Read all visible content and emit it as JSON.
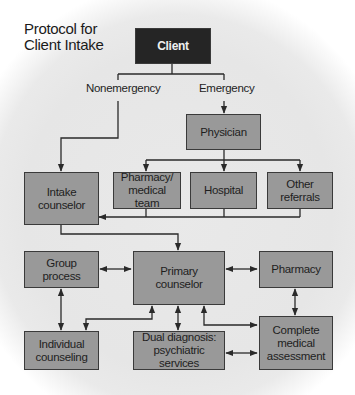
{
  "title": {
    "line1": "Protocol for",
    "line2": "Client Intake"
  },
  "colors": {
    "node_fill": "#999999",
    "start_fill": "#252525",
    "line": "#2a2a2a",
    "background": "#e6e6e6"
  },
  "branch_labels": {
    "nonemergency": "Nonemergency",
    "emergency": "Emergency"
  },
  "nodes": {
    "client": "Client",
    "physician": "Physician",
    "pharmacy_medical_team": {
      "line1": "Pharmacy/",
      "line2": "medical team"
    },
    "hospital": "Hospital",
    "other_referrals": {
      "line1": "Other",
      "line2": "referrals"
    },
    "intake_counselor": {
      "line1": "Intake",
      "line2": "counselor"
    },
    "group_process": {
      "line1": "Group",
      "line2": "process"
    },
    "primary_counselor": {
      "line1": "Primary",
      "line2": "counselor"
    },
    "pharmacy": "Pharmacy",
    "individual_counseling": {
      "line1": "Individual",
      "line2": "counseling"
    },
    "dual_diagnosis": {
      "line1": "Dual diagnosis:",
      "line2": "psychiatric services"
    },
    "complete_medical_assessment": {
      "line1": "Complete",
      "line2": "medical",
      "line3": "assessment"
    }
  },
  "edges": [
    {
      "from": "Client",
      "to": "Intake counselor",
      "label": "Nonemergency",
      "type": "one-way"
    },
    {
      "from": "Client",
      "to": "Physician",
      "label": "Emergency",
      "type": "one-way"
    },
    {
      "from": "Physician",
      "to": "Pharmacy/medical team",
      "type": "one-way"
    },
    {
      "from": "Physician",
      "to": "Hospital",
      "type": "one-way"
    },
    {
      "from": "Physician",
      "to": "Other referrals",
      "type": "one-way"
    },
    {
      "from": "Pharmacy/medical team",
      "to": "Intake counselor",
      "type": "one-way"
    },
    {
      "from": "Hospital",
      "to": "Intake counselor",
      "type": "one-way"
    },
    {
      "from": "Other referrals",
      "to": "Intake counselor",
      "type": "one-way"
    },
    {
      "from": "Intake counselor",
      "to": "Primary counselor",
      "type": "one-way"
    },
    {
      "from": "Group process",
      "to": "Primary counselor",
      "type": "two-way"
    },
    {
      "from": "Primary counselor",
      "to": "Pharmacy",
      "type": "two-way"
    },
    {
      "from": "Group process",
      "to": "Individual counseling",
      "type": "two-way"
    },
    {
      "from": "Primary counselor",
      "to": "Individual counseling",
      "type": "two-way"
    },
    {
      "from": "Primary counselor",
      "to": "Dual diagnosis: psychiatric services",
      "type": "two-way"
    },
    {
      "from": "Primary counselor",
      "to": "Complete medical assessment",
      "type": "two-way"
    },
    {
      "from": "Pharmacy",
      "to": "Complete medical assessment",
      "type": "two-way"
    },
    {
      "from": "Dual diagnosis: psychiatric services",
      "to": "Complete medical assessment",
      "type": "two-way"
    }
  ]
}
